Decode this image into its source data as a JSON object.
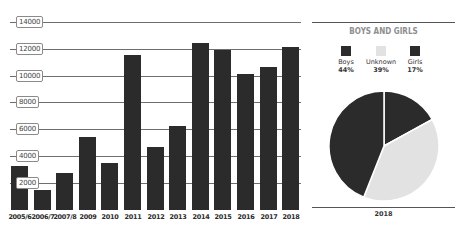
{
  "chart_data": [
    {
      "type": "bar",
      "title": "",
      "xlabel": "",
      "ylabel": "",
      "categories": [
        "2005/6",
        "2006/7",
        "2007/8",
        "2009",
        "2010",
        "2011",
        "2012",
        "2013",
        "2014",
        "2015",
        "2016",
        "2017",
        "2018"
      ],
      "values": [
        3250,
        1480,
        2750,
        5450,
        3480,
        11500,
        4700,
        6250,
        12450,
        11900,
        10100,
        10650,
        12150
      ],
      "yticks": [
        "2000",
        "4000",
        "6000",
        "8000",
        "10000",
        "12000",
        "14000"
      ],
      "ylim": [
        0,
        14000
      ],
      "grid": true,
      "bar_color": "#2b2b2b"
    },
    {
      "type": "pie",
      "title": "BOYS AND GIRLS",
      "xlabel": "2018",
      "legend_position": "top",
      "slices": [
        {
          "label": "Boys",
          "value": 44,
          "display": "44%",
          "color": "#2b2b2b"
        },
        {
          "label": "Unknown",
          "value": 39,
          "display": "39%",
          "color": "#e2e2e2"
        },
        {
          "label": "Girls",
          "value": 17,
          "display": "17%",
          "color": "#2b2b2b"
        }
      ]
    }
  ]
}
